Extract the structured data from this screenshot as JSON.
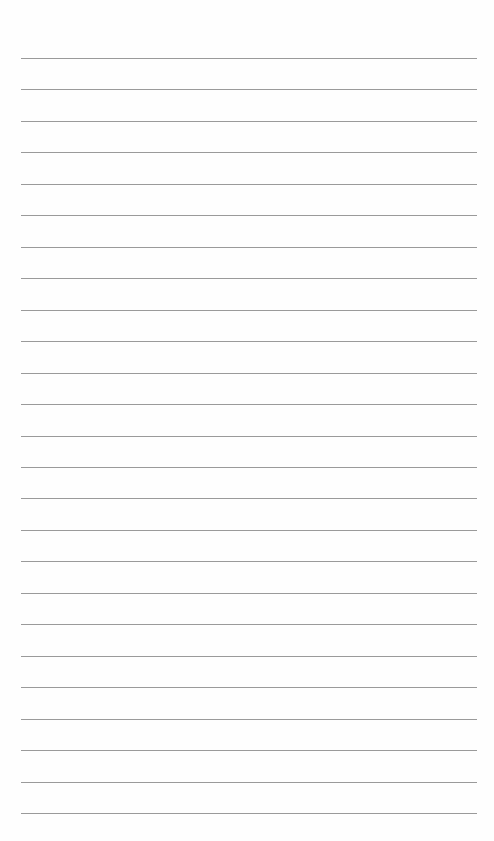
{
  "page": {
    "type": "lined-paper",
    "line_count": 25,
    "first_line_y": 58,
    "line_spacing": 31.46,
    "line_left": 21,
    "line_width": 456,
    "line_color": "#9a9a9a",
    "background_color": "#fefefe"
  }
}
